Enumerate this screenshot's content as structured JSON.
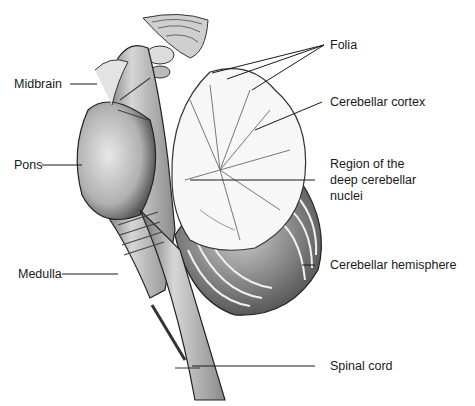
{
  "figure": {
    "labels": {
      "midbrain": "Midbrain",
      "pons": "Pons",
      "medulla": "Medulla",
      "folia": "Folia",
      "cerebellar_cortex": "Cerebellar cortex",
      "deep_nuclei_line1": "Region of the",
      "deep_nuclei_line2": "deep cerebellar",
      "deep_nuclei_line3": "nuclei",
      "cerebellar_hemisphere": "Cerebellar hemisphere",
      "spinal_cord": "Spinal cord"
    },
    "colors": {
      "background": "#ffffff",
      "ink": "#1a1a1a",
      "shade_dark": "#555555",
      "shade_mid": "#9a9a9a",
      "shade_light": "#d9d9d9"
    }
  }
}
